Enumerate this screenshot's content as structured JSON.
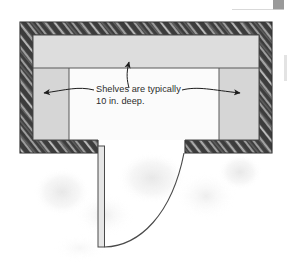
{
  "figure": {
    "type": "architectural-floor-plan",
    "annotations": [
      {
        "id": "shelf-depth-note",
        "line1": "Shelves are typically",
        "line2": "10 in. deep.",
        "leader_arrows": 3,
        "arrow_directions": [
          "up-left",
          "left",
          "right"
        ]
      }
    ],
    "colors": {
      "wall_fill": "#3c3c3c",
      "wall_hatch": "#f2f2f2",
      "shelf_fill": "#d2d2d2",
      "shelf_fill_light": "#dcdcdc",
      "floor_fill": "#fbfbfb",
      "line": "#4a4a4a",
      "text": "#2b2b2b",
      "page_background": "#ffffff",
      "smudge": "#ededed",
      "corner_marker": "#9a9a9a",
      "rule": "#d9d9d9"
    },
    "geometry": {
      "outer_wall": {
        "left": 20,
        "top": 22,
        "right": 272,
        "bottom": 153,
        "thickness": 13
      },
      "inner_room": {
        "left": 33,
        "top": 35,
        "right": 259,
        "bottom": 140
      },
      "shelf_band": {
        "top_shelf_bottom_y": 68,
        "left_shelf_right_x": 69,
        "right_shelf_left_x": 219
      },
      "door_opening": {
        "left_jamb_x": 98,
        "right_jamb_x": 185,
        "sill_y": 140
      },
      "door_leaf": {
        "x": 98,
        "y": 146,
        "width": 6,
        "height": 101
      },
      "swing_arc": {
        "from_x": 104,
        "from_y": 247,
        "to_x": 185,
        "to_y": 152,
        "radius": 96
      }
    }
  },
  "page_marks": {
    "corner_marker_name": "page-corner-marker",
    "top_rule_name": "page-top-rule",
    "right_rule_name": "page-right-edge-mark"
  }
}
